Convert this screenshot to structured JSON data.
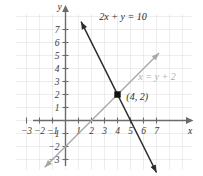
{
  "chart_data": {
    "type": "line",
    "title": "",
    "xlabel": "x",
    "ylabel": "y",
    "xlim": [
      -3.8,
      8.2
    ],
    "ylim": [
      -3.8,
      8.2
    ],
    "grid": true,
    "legend": "inline-labels",
    "xticks": [
      -3,
      -2,
      -1,
      1,
      2,
      3,
      4,
      5,
      6,
      7
    ],
    "yticks": [
      -3,
      -2,
      -1,
      1,
      2,
      3,
      4,
      5,
      6,
      7
    ],
    "xtick_labels": [
      "−3",
      "−2",
      "−1",
      "1",
      "2",
      "3",
      "4",
      "5",
      "6",
      "7"
    ],
    "ytick_labels": [
      "−3",
      "−2",
      "−1",
      "1",
      "2",
      "3",
      "4",
      "5",
      "6",
      "7"
    ],
    "series": [
      {
        "name": "2x + y = 10",
        "label": "2x + y = 10",
        "color": "#2b2b2b",
        "slope": -2,
        "intercept": 10,
        "x": [
          1.2,
          7.0
        ],
        "y": [
          7.6,
          -4.0
        ],
        "arrows": "both",
        "label_x": 2.6,
        "label_y": 7.7
      },
      {
        "name": "x = y + 2",
        "label": "x = y + 2",
        "color": "#b0b0b0",
        "slope": 1,
        "intercept": -2,
        "x": [
          -1.6,
          7.2
        ],
        "y": [
          -3.6,
          5.2
        ],
        "arrows": "both",
        "label_x": 5.6,
        "label_y": 3.1
      }
    ],
    "points": [
      {
        "name": "intersection",
        "x": 4,
        "y": 2,
        "label": "(4, 2)",
        "marker": "square",
        "color": "#111111",
        "label_offset_x": 0.45,
        "label_offset_y": -0.15
      }
    ]
  },
  "axes": {
    "x_axis_label": "x",
    "y_axis_label": "y"
  },
  "labels": {
    "equation_dark": "2x + y = 10",
    "equation_gray": "x = y + 2",
    "point": "(4, 2)"
  },
  "colors": {
    "line_dark": "#2b2b2b",
    "line_gray": "#b0b0b0",
    "axis": "#6b6b6b",
    "grid": "#e0e0e0",
    "marker": "#111111",
    "background": "#ffffff"
  },
  "ticks": {
    "x": [
      "−3",
      "−2",
      "−1",
      "1",
      "2",
      "3",
      "4",
      "5",
      "6",
      "7"
    ],
    "y": [
      "7",
      "6",
      "5",
      "4",
      "3",
      "2",
      "1",
      "−1",
      "−2",
      "−3"
    ]
  }
}
